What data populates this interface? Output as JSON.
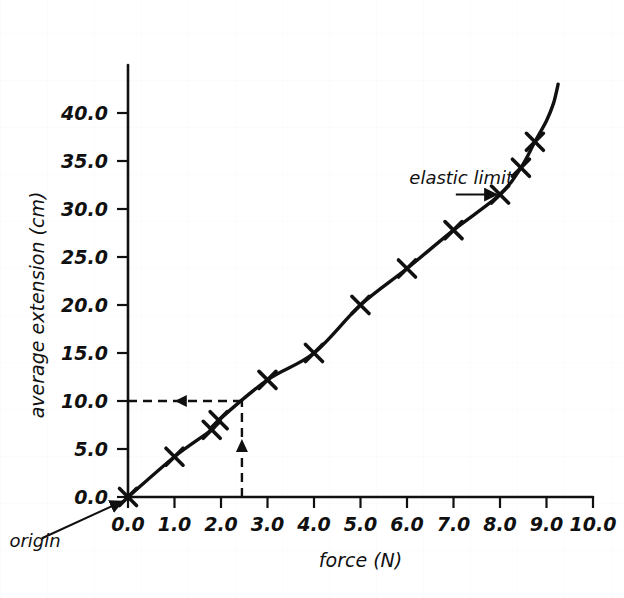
{
  "page": {
    "top_cut_text": "",
    "background": "#ffffff",
    "ink_color": "#101010"
  },
  "chart_data": {
    "type": "line",
    "title": "",
    "xlabel": "force (N)",
    "ylabel": "average extension (cm)",
    "xlim": [
      0.0,
      10.0
    ],
    "ylim": [
      0.0,
      43.0
    ],
    "xticks": [
      "0.0",
      "1.0",
      "2.0",
      "3.0",
      "4.0",
      "5.0",
      "6.0",
      "7.0",
      "8.0",
      "9.0",
      "10.0"
    ],
    "xtick_values": [
      0,
      1,
      2,
      3,
      4,
      5,
      6,
      7,
      8,
      9,
      10
    ],
    "yticks": [
      "0.0",
      "5.0",
      "10.0",
      "15.0",
      "20.0",
      "25.0",
      "30.0",
      "35.0",
      "40.0"
    ],
    "ytick_values": [
      0,
      5,
      10,
      15,
      20,
      25,
      30,
      35,
      40
    ],
    "grid": false,
    "legend": false,
    "marker": "x",
    "series": [
      {
        "name": "average extension",
        "x": [
          0.0,
          1.0,
          1.8,
          1.95,
          3.0,
          4.0,
          5.0,
          6.0,
          7.0,
          8.0,
          8.45,
          8.75
        ],
        "values": [
          0.0,
          4.2,
          7.0,
          8.0,
          12.2,
          15.0,
          20.0,
          23.8,
          27.8,
          31.5,
          34.3,
          37.0
        ]
      }
    ],
    "curve_tail": {
      "x": [
        8.75,
        9.0,
        9.15,
        9.25
      ],
      "values": [
        37.0,
        39.2,
        41.0,
        43.0
      ]
    },
    "annotations": [
      {
        "id": "elastic-limit",
        "label": "elastic limit",
        "text_x": 6.05,
        "text_y": 32.6,
        "arrow_from_x": 7.05,
        "arrow_from_y": 31.5,
        "arrow_to_x": 7.93,
        "arrow_to_y": 31.5
      },
      {
        "id": "origin",
        "label": "origin",
        "text_x": -2.55,
        "text_y": -5.2,
        "arrow_from_x": -1.85,
        "arrow_from_y": -4.3,
        "arrow_to_x": -0.12,
        "arrow_to_y": -0.45
      }
    ],
    "construction_lines": {
      "read_extension": 10.0,
      "read_force": 2.45,
      "horizontal": {
        "from_x": 0.0,
        "to_x": 2.45,
        "y": 10.0,
        "arrow_dir": "left",
        "arrow_at_x": 1.2
      },
      "vertical": {
        "x": 2.45,
        "from_y": 0.0,
        "to_y": 10.0,
        "arrow_dir": "up",
        "arrow_at_y": 5.0
      },
      "style": "dashed"
    }
  }
}
